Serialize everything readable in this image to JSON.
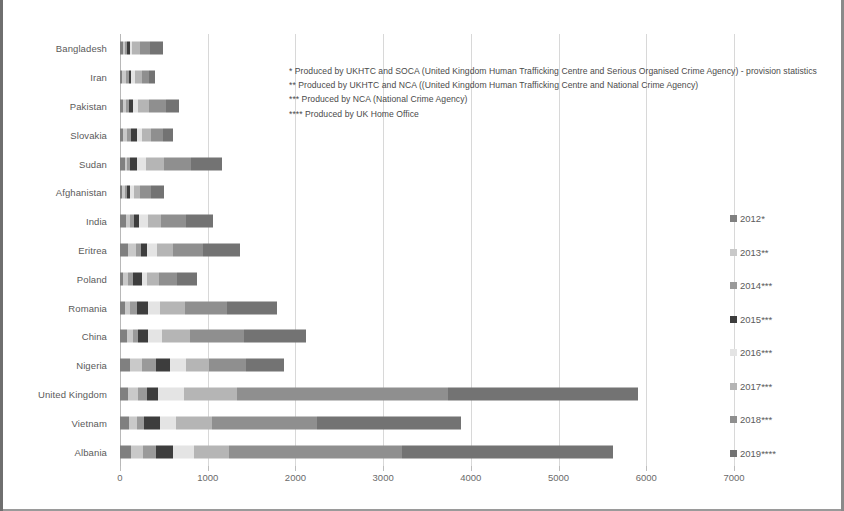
{
  "chart_data": {
    "type": "bar",
    "orientation": "horizontal",
    "stacked": true,
    "title": "",
    "xlabel": "",
    "ylabel": "",
    "xlim": [
      0,
      7000
    ],
    "xticks": [
      0,
      1000,
      2000,
      3000,
      4000,
      5000,
      6000,
      7000
    ],
    "xticklabels": [
      "0",
      "1000",
      "2000",
      "3000",
      "4000",
      "5000",
      "6000",
      "7000"
    ],
    "grid": true,
    "legend_position": "right",
    "categories": [
      "Bangladesh",
      "Iran",
      "Pakistan",
      "Slovakia",
      "Sudan",
      "Afghanistan",
      "India",
      "Eritrea",
      "Poland",
      "Romania",
      "China",
      "Nigeria",
      "United Kingdom",
      "Vietnam",
      "Albania"
    ],
    "series": [
      {
        "name": "2012*",
        "color": "#808080",
        "values": [
          30,
          25,
          35,
          30,
          60,
          28,
          70,
          95,
          30,
          55,
          75,
          110,
          95,
          100,
          125
        ]
      },
      {
        "name": "2013**",
        "color": "#c9c9c9",
        "values": [
          25,
          45,
          35,
          55,
          25,
          25,
          40,
          85,
          60,
          60,
          70,
          140,
          115,
          90,
          140
        ]
      },
      {
        "name": "2014***",
        "color": "#9a9a9a",
        "values": [
          20,
          35,
          30,
          45,
          30,
          30,
          45,
          55,
          55,
          75,
          60,
          155,
          95,
          85,
          150
        ]
      },
      {
        "name": "2015***",
        "color": "#3d3d3d",
        "values": [
          35,
          20,
          50,
          60,
          75,
          35,
          60,
          70,
          110,
          130,
          115,
          170,
          125,
          180,
          185
        ]
      },
      {
        "name": "2016***",
        "color": "#e4e4e4",
        "values": [
          30,
          45,
          55,
          65,
          110,
          40,
          100,
          120,
          55,
          135,
          160,
          175,
          295,
          185,
          245
        ]
      },
      {
        "name": "2017***",
        "color": "#b5b5b5",
        "values": [
          85,
          85,
          130,
          100,
          200,
          75,
          155,
          180,
          130,
          290,
          320,
          260,
          610,
          410,
          395
        ]
      },
      {
        "name": "2018***",
        "color": "#8f8f8f",
        "values": [
          120,
          75,
          185,
          130,
          305,
          115,
          280,
          345,
          210,
          480,
          615,
          425,
          2405,
          1200,
          1980
        ]
      },
      {
        "name": "2019****",
        "color": "#737373",
        "values": [
          145,
          70,
          150,
          115,
          355,
          152,
          310,
          420,
          230,
          565,
          705,
          435,
          2160,
          1640,
          2400
        ]
      }
    ]
  },
  "footnotes": [
    "* Produced by UKHTC  and SOCA (United Kingdom Human Trafficking Centre and Serious Organised Crime Agency) - provision statistics",
    "** Produced by UKHTC and NCA ((United Kingdom Human Trafficking Centre and National Crime Agency)",
    "*** Produced by NCA (National Crime Agency)",
    "**** Produced by UK Home Office"
  ]
}
